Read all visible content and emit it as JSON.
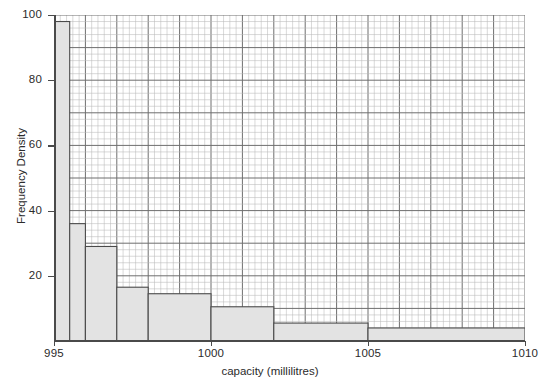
{
  "chart_data": {
    "type": "bar",
    "title": "",
    "subtitle": "",
    "xlabel": "capacity  (millilitres)",
    "ylabel": "Frequency Density",
    "xlim": [
      995,
      1010
    ],
    "ylim": [
      0,
      100
    ],
    "xticks": [
      995,
      1000,
      1005,
      1010
    ],
    "xtick_labels": [
      "995",
      "1000",
      "1005",
      "1010"
    ],
    "yticks": [
      20,
      40,
      60,
      80,
      100
    ],
    "ytick_labels": [
      "20",
      "40",
      "60",
      "80",
      "100"
    ],
    "grid": "graph-paper (minor 0.2 mL / 2 units, major 1 mL / 10 units)",
    "legend": "none",
    "bars": [
      {
        "x_start": 995.0,
        "x_end": 995.5,
        "value": 98.0
      },
      {
        "x_start": 995.5,
        "x_end": 996.0,
        "value": 36.0
      },
      {
        "x_start": 996.0,
        "x_end": 997.0,
        "value": 29.0
      },
      {
        "x_start": 997.0,
        "x_end": 998.0,
        "value": 16.5
      },
      {
        "x_start": 998.0,
        "x_end": 1000.0,
        "value": 14.5
      },
      {
        "x_start": 1000.0,
        "x_end": 1002.0,
        "value": 10.5
      },
      {
        "x_start": 1002.0,
        "x_end": 1005.0,
        "value": 5.5
      },
      {
        "x_start": 1005.0,
        "x_end": 1010.0,
        "value": 4.0
      }
    ],
    "bar_fill": "#e3e3e3",
    "bar_stroke": "#4a4a4a",
    "grid_major_color": "#6e6e6e",
    "grid_minor_color": "#b9b9b9",
    "axis_color": "#4a4a4a",
    "background": "#ffffff"
  }
}
